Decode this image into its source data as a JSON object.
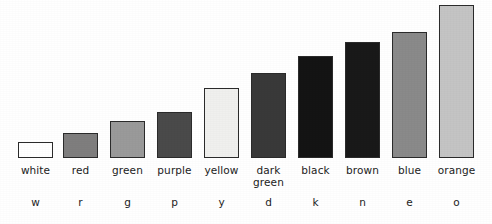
{
  "chart_data": {
    "type": "bar",
    "title": "",
    "subtitle": "",
    "xlabel": "",
    "ylabel": "",
    "grid": false,
    "legend": "none",
    "orientation": "vertical",
    "baseline_y_px": 158,
    "ylim": [
      0,
      160
    ],
    "categories": [
      "white",
      "red",
      "green",
      "purple",
      "yellow",
      "dark\ngreen",
      "black",
      "brown",
      "blue",
      "orange"
    ],
    "category_codes": [
      "w",
      "r",
      "g",
      "p",
      "y",
      "d",
      "k",
      "n",
      "e",
      "o"
    ],
    "values": [
      16,
      25,
      37,
      46,
      70,
      85,
      102,
      116,
      126,
      153
    ],
    "bar_fill_colors": [
      "#ffffff",
      "#7f7e7e",
      "#9a9a9a",
      "#4a4a4a",
      "#f0f0ee",
      "#393939",
      "#141414",
      "#191919",
      "#8a8a8a",
      "#c4c4c4"
    ],
    "bar_edge_color": "#2b2b2b",
    "bars": [
      {
        "category": "white",
        "code": "w",
        "value": 16,
        "top_px": 142,
        "left_px": 18,
        "width_px": 35,
        "fill": "#ffffff"
      },
      {
        "category": "red",
        "code": "r",
        "value": 25,
        "top_px": 133,
        "left_px": 63,
        "width_px": 35,
        "fill": "#7f7e7e"
      },
      {
        "category": "green",
        "code": "g",
        "value": 37,
        "top_px": 121,
        "left_px": 110,
        "width_px": 35,
        "fill": "#9a9a9a"
      },
      {
        "category": "purple",
        "code": "p",
        "value": 46,
        "top_px": 112,
        "left_px": 157,
        "width_px": 35,
        "fill": "#4a4a4a"
      },
      {
        "category": "yellow",
        "code": "y",
        "value": 70,
        "top_px": 88,
        "left_px": 204,
        "width_px": 35,
        "fill": "#f0f0ee"
      },
      {
        "category": "dark green",
        "code": "d",
        "value": 85,
        "top_px": 73,
        "left_px": 251,
        "width_px": 35,
        "fill": "#393939"
      },
      {
        "category": "black",
        "code": "k",
        "value": 102,
        "top_px": 56,
        "left_px": 298,
        "width_px": 35,
        "fill": "#141414"
      },
      {
        "category": "brown",
        "code": "n",
        "value": 116,
        "top_px": 42,
        "left_px": 345,
        "width_px": 35,
        "fill": "#191919"
      },
      {
        "category": "blue",
        "code": "e",
        "value": 126,
        "top_px": 32,
        "left_px": 392,
        "width_px": 35,
        "fill": "#8a8a8a"
      },
      {
        "category": "orange",
        "code": "o",
        "value": 153,
        "top_px": 5,
        "left_px": 439,
        "width_px": 35,
        "fill": "#c4c4c4"
      }
    ]
  },
  "figure": {
    "background_color": "#ffffff",
    "name": "color-preference-bar-chart"
  }
}
